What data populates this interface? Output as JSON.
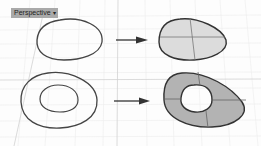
{
  "viewport": {
    "title": "Perspective",
    "menu_caret": "▾",
    "background": "#fdfdfd",
    "grid_color": "#e6e6e6",
    "axis_color": "#cfcfcf"
  },
  "illustration": {
    "rows": [
      {
        "input": "single closed curve",
        "output": "planar surface (light fill)",
        "fill": "#dcdcdc"
      },
      {
        "input": "outer curve with inner hole curve",
        "output": "planar surface with hole (dark fill)",
        "fill": "#b3b3b3"
      }
    ],
    "curve_color": "#444444",
    "arrow_color": "#333333"
  }
}
